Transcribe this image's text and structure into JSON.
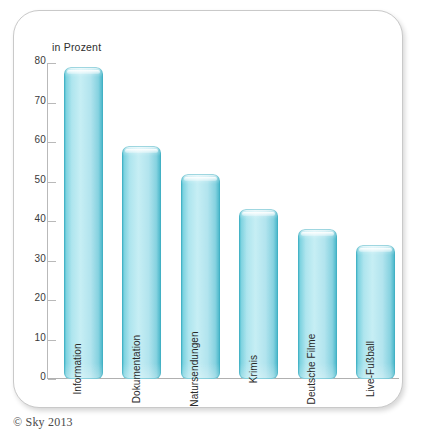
{
  "chart_data": {
    "type": "bar",
    "title": "",
    "subtitle": "",
    "xlabel": "",
    "ylabel": "in Prozent",
    "ylim": [
      0,
      80
    ],
    "yticks": [
      0,
      10,
      20,
      30,
      40,
      50,
      60,
      70,
      80
    ],
    "grid": false,
    "legend": "none",
    "orientation": "vertical",
    "bar_label_rotation": -90,
    "categories": [
      "Information",
      "Dokumentation",
      "Natursendungen",
      "Krimis",
      "Deutsche Filme",
      "Live-Fußball"
    ],
    "values": [
      79,
      59,
      52,
      43,
      38,
      34
    ],
    "colors": {
      "bar_edge": "#3fb4c8",
      "bar_mid": "#c6eef4",
      "bar_outline": "#3caabe",
      "axis": "#b9b9b9",
      "tick_text": "#3a3a3a",
      "bar_label_text": "#2a2a2a",
      "card_border": "#c9c9c9",
      "background": "#ffffff"
    }
  },
  "footer": {
    "copyright": "© Sky 2013"
  }
}
